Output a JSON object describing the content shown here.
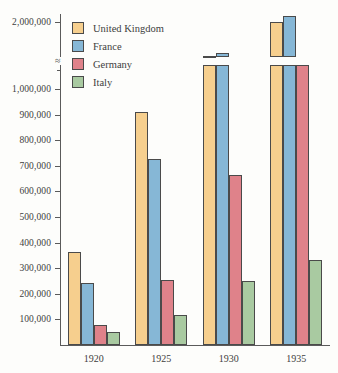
{
  "chart_data": {
    "type": "bar",
    "title": "",
    "subtitle": "",
    "xlabel": "",
    "ylabel": "",
    "categories": [
      "1920",
      "1925",
      "1930",
      "1935"
    ],
    "series": [
      {
        "name": "United Kingdom",
        "color": "#f6cf8e",
        "values": [
          365000,
          910000,
          1450000,
          2000000
        ]
      },
      {
        "name": "France",
        "color": "#86b7d6",
        "values": [
          243000,
          727000,
          1500000,
          2100000
        ]
      },
      {
        "name": "Germany",
        "color": "#df828a",
        "values": [
          78000,
          255000,
          663000,
          1050000
        ]
      },
      {
        "name": "Italy",
        "color": "#a9caa1",
        "values": [
          50000,
          117000,
          250000,
          332000
        ]
      }
    ],
    "ylim": [
      0,
      2100000
    ],
    "y_tick_labels": [
      "100,000",
      "200,000",
      "300,000",
      "400,000",
      "500,000",
      "600,000",
      "700,000",
      "800,000",
      "900,000",
      "1,000,000",
      "2,000,000"
    ],
    "y_tick_values": [
      100000,
      200000,
      300000,
      400000,
      500000,
      600000,
      700000,
      800000,
      900000,
      1000000,
      2000000
    ],
    "axis_break": {
      "present": true,
      "glyph": "≈",
      "between": [
        1000000,
        2000000
      ]
    },
    "grid": false,
    "legend_position": "top-left",
    "legend": [
      "United Kingdom",
      "France",
      "Germany",
      "Italy"
    ]
  },
  "axis": {
    "tick_color": "#5a5a5a",
    "line_color": "#5a5a5a"
  }
}
